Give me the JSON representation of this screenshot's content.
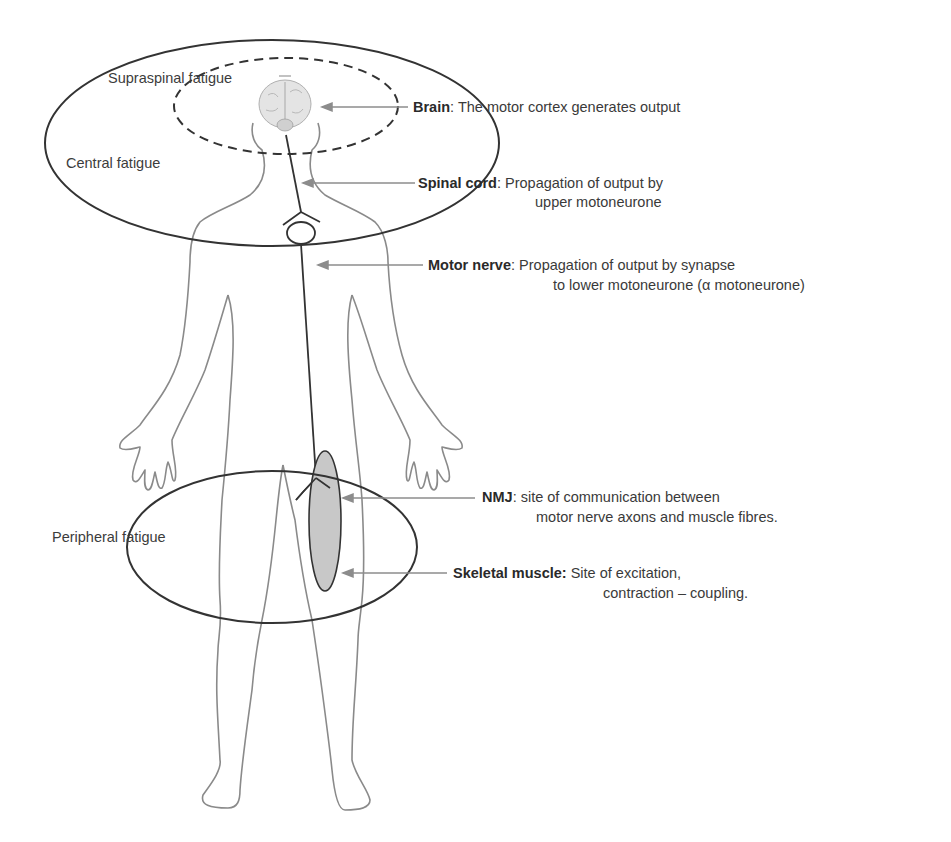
{
  "diagram": {
    "regions": {
      "supraspinal": "Supraspinal fatigue",
      "central": "Central fatigue",
      "peripheral": "Peripheral fatigue"
    },
    "annotations": [
      {
        "term": "Brain",
        "sep": ": ",
        "line1": "The motor cortex generates output",
        "line2": ""
      },
      {
        "term": "Spinal cord",
        "sep": ": ",
        "line1": "Propagation of output by",
        "line2": "upper motoneurone"
      },
      {
        "term": "Motor nerve",
        "sep": ": ",
        "line1": "Propagation of output by synapse",
        "line2": "to lower motoneurone (α  motoneurone)"
      },
      {
        "term": "NMJ",
        "sep": ": ",
        "line1": "site of communication between",
        "line2": "motor nerve axons and muscle fibres."
      },
      {
        "term": "Skeletal muscle:",
        "sep": " ",
        "line1": "Site of excitation,",
        "line2": "contraction – coupling."
      }
    ],
    "colors": {
      "outline": "#3a3a3a",
      "body": "#8a8a8a",
      "arrow": "#8c8c8c",
      "muscle_fill": "#c8c8c8",
      "text": "#3a3a3a"
    }
  }
}
